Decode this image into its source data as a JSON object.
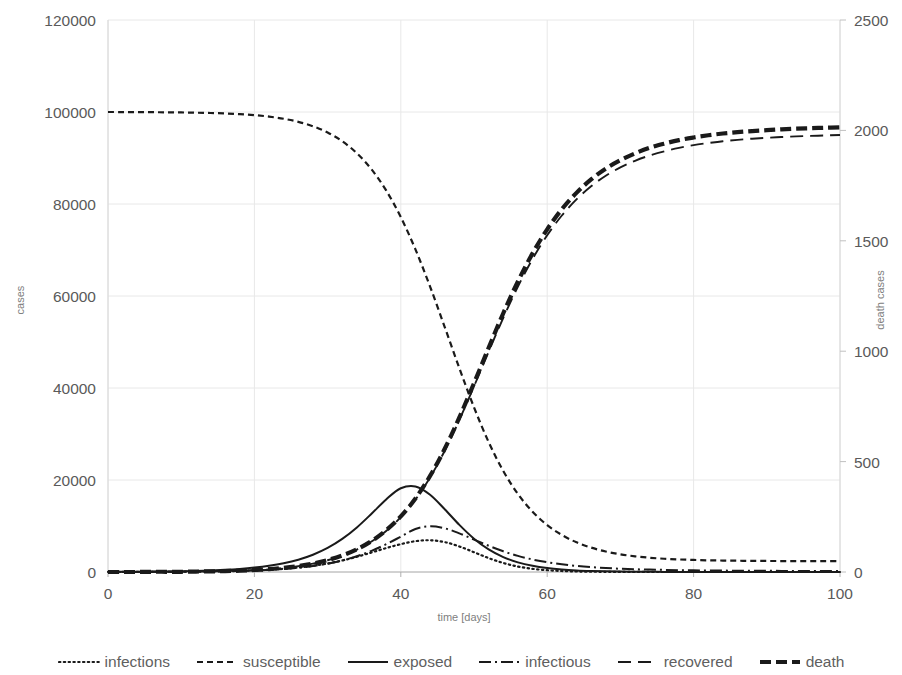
{
  "chart_data": {
    "type": "line",
    "title": "",
    "subtitle": "",
    "xlabel": "time [days]",
    "ylabel": "cases",
    "y2label": "death cases",
    "xlim": [
      0,
      100
    ],
    "ylim": [
      0,
      120000
    ],
    "y2lim": [
      0,
      2500
    ],
    "xticks": [
      "0",
      "20",
      "40",
      "60",
      "80",
      "100"
    ],
    "xtick_values": [
      0,
      20,
      40,
      60,
      80,
      100
    ],
    "yticks": [
      "0",
      "20000",
      "40000",
      "60000",
      "80000",
      "100000",
      "120000"
    ],
    "ytick_values": [
      0,
      20000,
      40000,
      60000,
      80000,
      100000,
      120000
    ],
    "y2ticks": [
      "0",
      "500",
      "1000",
      "1500",
      "2000",
      "2500"
    ],
    "y2tick_values": [
      0,
      500,
      1000,
      1500,
      2000,
      2500
    ],
    "grid": true,
    "grid_color": "#e8e8e8",
    "legend_position": "bottom",
    "line_color": "#1a1a1a",
    "x": [
      0,
      2,
      4,
      6,
      8,
      10,
      12,
      14,
      16,
      18,
      20,
      22,
      24,
      26,
      28,
      30,
      32,
      34,
      36,
      38,
      40,
      42,
      44,
      46,
      48,
      50,
      52,
      54,
      56,
      58,
      60,
      62,
      64,
      66,
      68,
      70,
      72,
      74,
      76,
      78,
      80,
      82,
      84,
      86,
      88,
      90,
      92,
      94,
      96,
      98,
      100
    ],
    "series": [
      {
        "name": "infections",
        "axis": "left",
        "dash": "dotted",
        "values": [
          10,
          14,
          20,
          29,
          41,
          59,
          84,
          120,
          170,
          242,
          344,
          487,
          688,
          966,
          1345,
          1852,
          2505,
          3310,
          4240,
          5200,
          6050,
          6700,
          6900,
          6500,
          5550,
          4300,
          3020,
          1960,
          1190,
          690,
          390,
          215,
          118,
          64,
          35,
          19,
          10,
          6,
          3,
          2,
          1,
          1,
          0,
          0,
          0,
          0,
          0,
          0,
          0,
          0,
          0
        ]
      },
      {
        "name": "susceptible",
        "axis": "left",
        "dash": "dashed-short",
        "values": [
          100000,
          99990,
          99980,
          99960,
          99930,
          99900,
          99850,
          99780,
          99680,
          99530,
          99320,
          99000,
          98530,
          97860,
          96900,
          95540,
          93640,
          91040,
          87540,
          82950,
          77150,
          70130,
          62050,
          53250,
          44300,
          35800,
          28250,
          21950,
          16950,
          13100,
          10200,
          8050,
          6450,
          5300,
          4450,
          3850,
          3400,
          3100,
          2880,
          2730,
          2620,
          2540,
          2490,
          2450,
          2420,
          2400,
          2385,
          2375,
          2365,
          2360,
          2355
        ]
      },
      {
        "name": "exposed",
        "axis": "left",
        "dash": "solid",
        "values": [
          30,
          42,
          59,
          84,
          119,
          168,
          238,
          337,
          477,
          675,
          955,
          1350,
          1905,
          2680,
          3760,
          5230,
          7190,
          9690,
          12670,
          15780,
          18200,
          18600,
          16800,
          13650,
          10250,
          7250,
          4920,
          3250,
          2100,
          1340,
          850,
          540,
          345,
          220,
          142,
          92,
          60,
          40,
          27,
          18,
          12,
          8,
          6,
          4,
          3,
          2,
          2,
          1,
          1,
          1,
          0
        ]
      },
      {
        "name": "infectious",
        "axis": "left",
        "dash": "dash-dot",
        "values": [
          10,
          14,
          20,
          28,
          40,
          57,
          81,
          115,
          163,
          231,
          327,
          463,
          655,
          924,
          1298,
          1814,
          2510,
          3430,
          4600,
          6040,
          7680,
          9350,
          9950,
          9500,
          8400,
          7050,
          5700,
          4500,
          3500,
          2720,
          2120,
          1660,
          1310,
          1050,
          860,
          710,
          600,
          520,
          455,
          405,
          365,
          330,
          305,
          285,
          268,
          255,
          243,
          234,
          226,
          220,
          215
        ]
      },
      {
        "name": "recovered",
        "axis": "left",
        "dash": "dashed-long",
        "values": [
          0,
          5,
          12,
          22,
          36,
          57,
          88,
          133,
          199,
          294,
          430,
          624,
          899,
          1284,
          1820,
          2555,
          3550,
          4880,
          6630,
          8930,
          11920,
          15750,
          20550,
          26350,
          33050,
          40350,
          47900,
          55250,
          62050,
          68050,
          73200,
          77500,
          81000,
          83850,
          86150,
          87950,
          89400,
          90550,
          91450,
          92200,
          92800,
          93250,
          93650,
          93950,
          94200,
          94400,
          94550,
          94700,
          94800,
          94900,
          95000
        ]
      },
      {
        "name": "death",
        "axis": "right",
        "dash": "dashed-thick",
        "values": [
          0,
          0,
          0,
          1,
          1,
          1,
          2,
          3,
          4,
          6,
          9,
          13,
          19,
          27,
          38,
          54,
          75,
          103,
          140,
          189,
          252,
          333,
          435,
          558,
          700,
          855,
          1015,
          1172,
          1316,
          1443,
          1552,
          1643,
          1717,
          1778,
          1827,
          1865,
          1896,
          1921,
          1940,
          1956,
          1968,
          1978,
          1986,
          1992,
          1997,
          2001,
          2005,
          2008,
          2010,
          2012,
          2014
        ]
      }
    ]
  },
  "legend": {
    "items": [
      {
        "label": "infections",
        "style": "dotted"
      },
      {
        "label": "susceptible",
        "style": "dashed-short"
      },
      {
        "label": "exposed",
        "style": "solid"
      },
      {
        "label": "infectious",
        "style": "dash-dot"
      },
      {
        "label": "recovered",
        "style": "dashed-long"
      },
      {
        "label": "death",
        "style": "dashed-thick"
      }
    ]
  }
}
